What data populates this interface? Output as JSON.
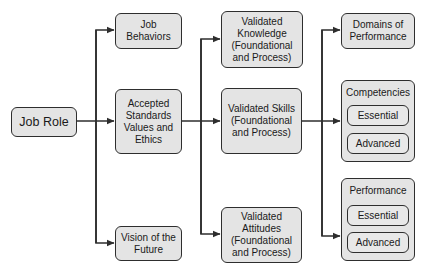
{
  "diagram": {
    "root": {
      "label": "Job Role"
    },
    "column1": [
      {
        "label": "Job\nBehaviors"
      },
      {
        "label": "Accepted Standards Values and Ethics"
      },
      {
        "label": "Vision of the Future"
      }
    ],
    "column2": [
      {
        "label": "Validated Knowledge (Foundational and Process)"
      },
      {
        "label": "Validated Skills (Foundational and Process)"
      },
      {
        "label": "Validated Attitudes (Foundational and Process)"
      }
    ],
    "column3": {
      "domains": {
        "label": "Domains of Performance"
      },
      "competencies": {
        "title": "Competencies",
        "items": [
          "Essential",
          "Advanced"
        ]
      },
      "performance": {
        "title": "Performance",
        "items": [
          "Essential",
          "Advanced"
        ]
      }
    },
    "edges": [
      [
        "Job Role",
        "Job Behaviors"
      ],
      [
        "Job Role",
        "Accepted Standards Values and Ethics"
      ],
      [
        "Job Role",
        "Vision of the Future"
      ],
      [
        "Accepted Standards Values and Ethics",
        "Validated Knowledge"
      ],
      [
        "Accepted Standards Values and Ethics",
        "Validated Skills"
      ],
      [
        "Accepted Standards Values and Ethics",
        "Validated Attitudes"
      ],
      [
        "Validated Skills",
        "Domains of Performance"
      ],
      [
        "Validated Skills",
        "Competencies"
      ],
      [
        "Validated Skills",
        "Performance"
      ]
    ],
    "colors": {
      "box_fill": "#e4e4e4",
      "stroke": "#2e2e2e",
      "background": "#ffffff"
    }
  }
}
